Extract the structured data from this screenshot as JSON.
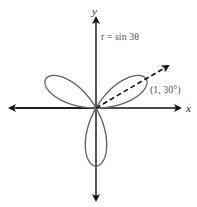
{
  "figure": {
    "equation_label": "r = sin 3θ",
    "point_label": "(1, 30°)",
    "x_axis_label": "x",
    "y_axis_label": "y"
  },
  "colors": {
    "curve": "#666666",
    "axes": "#111111",
    "text": "#555555"
  },
  "chart_data": {
    "type": "line",
    "title": "r = sin 3θ",
    "petals": [
      {
        "angle_deg": 30,
        "r_max": 1
      },
      {
        "angle_deg": 150,
        "r_max": 1
      },
      {
        "angle_deg": 270,
        "r_max": 1
      }
    ],
    "annotation": {
      "label": "(1, 30°)",
      "r": 1,
      "theta_deg": 30
    },
    "xlabel": "x",
    "ylabel": "y"
  }
}
